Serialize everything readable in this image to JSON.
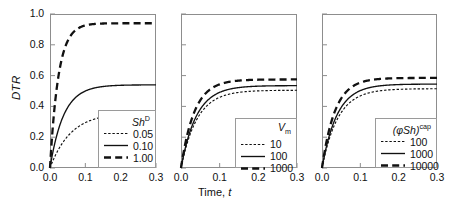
{
  "figure": {
    "y_axis_label": "DTR",
    "x_axis_label_prefix": "Time, ",
    "x_axis_label_var": "t"
  },
  "axes": {
    "yticks": [
      "0.0",
      "0.2",
      "0.4",
      "0.6",
      "0.8",
      "1.0"
    ],
    "ytick_values": [
      0.0,
      0.2,
      0.4,
      0.6,
      0.8,
      1.0
    ],
    "xticks": [
      "0.0",
      "0.1",
      "0.2",
      "0.3"
    ],
    "xtick_values": [
      0.0,
      0.1,
      0.2,
      0.3
    ],
    "ylim": [
      0.0,
      1.0
    ],
    "xlim": [
      0.0,
      0.3
    ]
  },
  "panels": [
    {
      "id": "panel-1",
      "legend_title_main": "Sh",
      "legend_title_sup": "D",
      "legend_title_plain": "Shᴰ",
      "entries": [
        {
          "label": "0.05",
          "style": "dotted"
        },
        {
          "label": "0.10",
          "style": "solid"
        },
        {
          "label": "1.00",
          "style": "dashed"
        }
      ]
    },
    {
      "id": "panel-2",
      "legend_title_main": "V",
      "legend_title_sub": "m",
      "legend_title_plain": "Vₘ",
      "entries": [
        {
          "label": "10",
          "style": "dotted"
        },
        {
          "label": "100",
          "style": "solid"
        },
        {
          "label": "1000",
          "style": "dashed"
        }
      ]
    },
    {
      "id": "panel-3",
      "legend_title_main": "(φSh)",
      "legend_title_sup": "cap",
      "legend_title_plain": "(φSh)ᶜᵃᵖ",
      "entries": [
        {
          "label": "100",
          "style": "dotted"
        },
        {
          "label": "1000",
          "style": "solid"
        },
        {
          "label": "10000",
          "style": "dashed"
        }
      ]
    }
  ],
  "chart_data": {
    "type": "line",
    "title": "",
    "xlabel": "Time, t",
    "ylabel": "DTR",
    "xlim": [
      0.0,
      0.3
    ],
    "ylim": [
      0.0,
      1.0
    ],
    "grid": false,
    "legend_position": "lower-right inside axes",
    "subplots": [
      {
        "name": "panel-1",
        "legend_title": "Sh^D",
        "series": [
          {
            "name": "0.05",
            "style": "dotted",
            "plateau": 0.36,
            "rate": 17.0,
            "x": [
              0.0,
              0.01,
              0.02,
              0.03,
              0.04,
              0.05,
              0.06,
              0.07,
              0.08,
              0.1,
              0.12,
              0.15,
              0.2,
              0.25,
              0.3
            ],
            "y": [
              0.02,
              0.07,
              0.12,
              0.16,
              0.2,
              0.23,
              0.26,
              0.28,
              0.3,
              0.33,
              0.345,
              0.355,
              0.36,
              0.36,
              0.36
            ]
          },
          {
            "name": "0.10",
            "style": "solid",
            "plateau": 0.54,
            "rate": 26.0,
            "x": [
              0.0,
              0.01,
              0.02,
              0.03,
              0.04,
              0.05,
              0.06,
              0.07,
              0.08,
              0.1,
              0.12,
              0.15,
              0.2,
              0.25,
              0.3
            ],
            "y": [
              0.02,
              0.13,
              0.23,
              0.3,
              0.36,
              0.4,
              0.44,
              0.47,
              0.49,
              0.515,
              0.53,
              0.538,
              0.54,
              0.54,
              0.54
            ]
          },
          {
            "name": "1.00",
            "style": "dashed",
            "plateau": 0.94,
            "rate": 42.0,
            "x": [
              0.0,
              0.01,
              0.02,
              0.03,
              0.04,
              0.05,
              0.06,
              0.07,
              0.08,
              0.1,
              0.12,
              0.15,
              0.2,
              0.25,
              0.3
            ],
            "y": [
              0.02,
              0.33,
              0.55,
              0.7,
              0.79,
              0.855,
              0.89,
              0.91,
              0.925,
              0.935,
              0.94,
              0.94,
              0.94,
              0.94,
              0.94
            ]
          }
        ]
      },
      {
        "name": "panel-2",
        "legend_title": "V_m",
        "series": [
          {
            "name": "10",
            "style": "dotted",
            "plateau": 0.505,
            "rate": 24.0,
            "x": [
              0.0,
              0.01,
              0.02,
              0.03,
              0.04,
              0.05,
              0.06,
              0.07,
              0.08,
              0.1,
              0.12,
              0.15,
              0.2,
              0.25,
              0.3
            ],
            "y": [
              0.01,
              0.1,
              0.19,
              0.26,
              0.32,
              0.37,
              0.405,
              0.435,
              0.455,
              0.485,
              0.497,
              0.503,
              0.505,
              0.505,
              0.505
            ]
          },
          {
            "name": "100",
            "style": "solid",
            "plateau": 0.535,
            "rate": 25.0,
            "x": [
              0.0,
              0.01,
              0.02,
              0.03,
              0.04,
              0.05,
              0.06,
              0.07,
              0.08,
              0.1,
              0.12,
              0.15,
              0.2,
              0.25,
              0.3
            ],
            "y": [
              0.01,
              0.11,
              0.2,
              0.28,
              0.34,
              0.39,
              0.43,
              0.46,
              0.48,
              0.512,
              0.526,
              0.533,
              0.535,
              0.535,
              0.535
            ]
          },
          {
            "name": "1000",
            "style": "dashed",
            "plateau": 0.575,
            "rate": 29.0,
            "x": [
              0.0,
              0.01,
              0.02,
              0.03,
              0.04,
              0.05,
              0.06,
              0.07,
              0.08,
              0.1,
              0.12,
              0.15,
              0.2,
              0.25,
              0.3
            ],
            "y": [
              0.01,
              0.14,
              0.25,
              0.33,
              0.4,
              0.45,
              0.49,
              0.515,
              0.535,
              0.557,
              0.568,
              0.574,
              0.575,
              0.575,
              0.575
            ]
          }
        ]
      },
      {
        "name": "panel-3",
        "legend_title": "(phi Sh)^cap",
        "series": [
          {
            "name": "100",
            "style": "dotted",
            "plateau": 0.515,
            "rate": 24.0,
            "x": [
              0.0,
              0.01,
              0.02,
              0.03,
              0.04,
              0.05,
              0.06,
              0.07,
              0.08,
              0.1,
              0.12,
              0.15,
              0.2,
              0.25,
              0.3
            ],
            "y": [
              0.01,
              0.1,
              0.195,
              0.27,
              0.33,
              0.375,
              0.415,
              0.443,
              0.465,
              0.495,
              0.507,
              0.513,
              0.515,
              0.515,
              0.515
            ]
          },
          {
            "name": "1000",
            "style": "solid",
            "plateau": 0.545,
            "rate": 25.5,
            "x": [
              0.0,
              0.01,
              0.02,
              0.03,
              0.04,
              0.05,
              0.06,
              0.07,
              0.08,
              0.1,
              0.12,
              0.15,
              0.2,
              0.25,
              0.3
            ],
            "y": [
              0.01,
              0.115,
              0.21,
              0.29,
              0.35,
              0.4,
              0.44,
              0.47,
              0.49,
              0.522,
              0.536,
              0.543,
              0.545,
              0.545,
              0.545
            ]
          },
          {
            "name": "10000",
            "style": "dashed",
            "plateau": 0.585,
            "rate": 29.5,
            "x": [
              0.0,
              0.01,
              0.02,
              0.03,
              0.04,
              0.05,
              0.06,
              0.07,
              0.08,
              0.1,
              0.12,
              0.15,
              0.2,
              0.25,
              0.3
            ],
            "y": [
              0.01,
              0.145,
              0.26,
              0.34,
              0.41,
              0.46,
              0.5,
              0.525,
              0.545,
              0.567,
              0.578,
              0.584,
              0.585,
              0.585,
              0.585
            ]
          }
        ]
      }
    ]
  }
}
